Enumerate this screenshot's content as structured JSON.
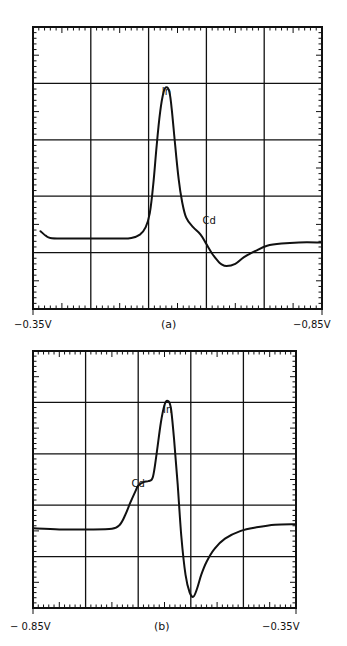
{
  "chart_data": [
    {
      "type": "line",
      "panel": "a",
      "caption": "(a)",
      "title": "",
      "xlabel": "",
      "ylabel": "",
      "x_start_label": "−0.35V",
      "x_end_label": "−0,85V",
      "xlim": [
        -0.35,
        -0.85
      ],
      "ylim": [
        0,
        5
      ],
      "grid": true,
      "grid_divisions": {
        "x": 5,
        "y": 5
      },
      "annotations": [
        {
          "text": "In",
          "x": -0.581,
          "y": 3.8
        },
        {
          "text": "Cd",
          "x": -0.655,
          "y": 1.5
        }
      ],
      "series": [
        {
          "name": "polarogram-a",
          "x": [
            -0.363,
            -0.372,
            -0.38,
            -0.4,
            -0.45,
            -0.5,
            -0.52,
            -0.535,
            -0.545,
            -0.552,
            -0.558,
            -0.564,
            -0.57,
            -0.576,
            -0.581,
            -0.586,
            -0.59,
            -0.596,
            -0.602,
            -0.608,
            -0.615,
            -0.627,
            -0.64,
            -0.65,
            -0.66,
            -0.67,
            -0.675,
            -0.685,
            -0.7,
            -0.715,
            -0.735,
            -0.755,
            -0.78,
            -0.81,
            -0.849
          ],
          "y": [
            1.38,
            1.3,
            1.26,
            1.25,
            1.25,
            1.25,
            1.26,
            1.32,
            1.45,
            1.7,
            2.2,
            2.9,
            3.5,
            3.85,
            3.93,
            3.85,
            3.55,
            2.9,
            2.3,
            1.9,
            1.62,
            1.45,
            1.32,
            1.15,
            0.98,
            0.85,
            0.8,
            0.76,
            0.8,
            0.92,
            1.03,
            1.12,
            1.16,
            1.18,
            1.18
          ]
        }
      ]
    },
    {
      "type": "line",
      "panel": "b",
      "caption": "(b)",
      "title": "",
      "xlabel": "",
      "ylabel": "",
      "x_start_label": "− 0.85V",
      "x_end_label": "−0.35V",
      "xlim": [
        -0.85,
        -0.35
      ],
      "ylim": [
        0,
        5
      ],
      "grid": true,
      "grid_divisions": {
        "x": 5,
        "y": 5
      },
      "annotations": [
        {
          "text": "In",
          "x": -0.594,
          "y": 3.8
        },
        {
          "text": "Cd",
          "x": -0.65,
          "y": 2.35
        }
      ],
      "series": [
        {
          "name": "polarogram-b",
          "x": [
            -0.849,
            -0.8,
            -0.75,
            -0.7,
            -0.685,
            -0.675,
            -0.665,
            -0.655,
            -0.65,
            -0.64,
            -0.63,
            -0.622,
            -0.615,
            -0.607,
            -0.6,
            -0.594,
            -0.588,
            -0.582,
            -0.575,
            -0.568,
            -0.56,
            -0.552,
            -0.545,
            -0.538,
            -0.53,
            -0.52,
            -0.505,
            -0.485,
            -0.455,
            -0.425,
            -0.39,
            -0.351
          ],
          "y": [
            1.55,
            1.53,
            1.53,
            1.54,
            1.62,
            1.8,
            2.05,
            2.28,
            2.38,
            2.45,
            2.47,
            2.55,
            3.0,
            3.6,
            3.95,
            4.03,
            3.9,
            3.3,
            2.4,
            1.4,
            0.65,
            0.3,
            0.22,
            0.38,
            0.65,
            0.9,
            1.15,
            1.35,
            1.5,
            1.57,
            1.62,
            1.63
          ]
        }
      ]
    }
  ]
}
